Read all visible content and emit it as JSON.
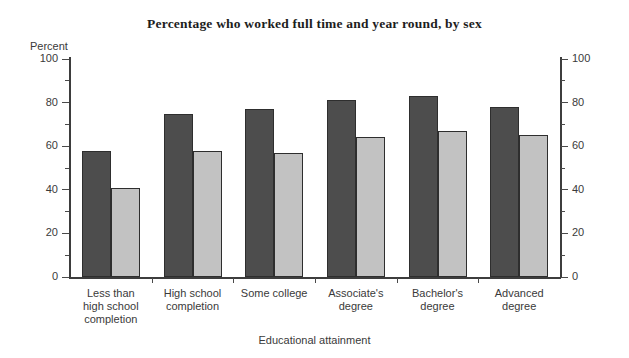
{
  "chart_data": {
    "type": "bar",
    "title": "Percentage who worked full time and year round, by sex",
    "xlabel": "Educational attainment",
    "ylabel": "Percent",
    "ylim": [
      0,
      100
    ],
    "ytick_step": 20,
    "yminor_step": 10,
    "grid": false,
    "legend": null,
    "dual_axis": true,
    "categories": [
      "Less than high school completion",
      "High school completion",
      "Some college",
      "Associate's degree",
      "Bachelor's degree",
      "Advanced degree"
    ],
    "category_lines": [
      [
        "Less than",
        "high school",
        "completion"
      ],
      [
        "High school",
        "completion"
      ],
      [
        "Some college"
      ],
      [
        "Associate's",
        "degree"
      ],
      [
        "Bachelor's",
        "degree"
      ],
      [
        "Advanced",
        "degree"
      ]
    ],
    "series": [
      {
        "name": "Male",
        "color": "#4d4d4d",
        "values": [
          58,
          75,
          77,
          81,
          83,
          78
        ]
      },
      {
        "name": "Female",
        "color": "#c2c2c2",
        "values": [
          41,
          58,
          57,
          64,
          67,
          65
        ]
      }
    ],
    "ytick_labels_left": [
      "100",
      "80",
      "60",
      "40",
      "20",
      "0"
    ],
    "ytick_labels_right": [
      "100",
      "80",
      "60",
      "40",
      "20",
      "0"
    ]
  },
  "axis": {
    "y_title": "Percent"
  }
}
